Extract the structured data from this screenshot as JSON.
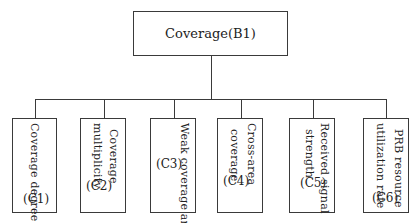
{
  "root": {
    "label": "Coverage(B1)"
  },
  "children": [
    {
      "lines": [
        "Coverage degree"
      ],
      "code": "(C1)"
    },
    {
      "lines": [
        "Coverage",
        "multiplicity"
      ],
      "code": "(C2)"
    },
    {
      "lines": [
        "Weak coverage area"
      ],
      "code": "(C3)"
    },
    {
      "lines": [
        "Cross-area",
        "coverage"
      ],
      "code": "(C4)"
    },
    {
      "lines": [
        "Received signal",
        "strength"
      ],
      "code": "(C5)"
    },
    {
      "lines": [
        "PRB resource",
        "utilization rate"
      ],
      "code": "(C6)"
    }
  ],
  "colors": {
    "line": "#3a3a3a",
    "background": "#ffffff"
  }
}
